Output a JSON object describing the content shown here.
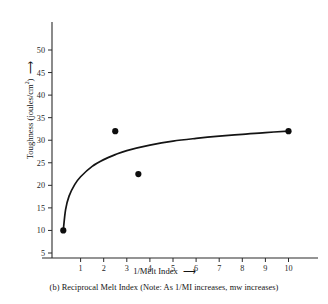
{
  "chart_data": {
    "type": "scatter",
    "title": "",
    "subtitle": "",
    "caption": "(b) Reciprocal Melt Index (Note: As 1/MI increases, mw increases)",
    "xlabel": "1/Melt Index",
    "xlabel_arrow": "⟶",
    "ylabel_prefix": "Toughness (joules/cm",
    "ylabel_exponent": "2",
    "ylabel_suffix": ")",
    "ylabel_arrow": "⟶",
    "xlim": [
      0,
      11.7
    ],
    "ylim": [
      3.5,
      52
    ],
    "grid": false,
    "legend": false,
    "xticks": [
      1,
      2,
      3,
      4,
      5,
      6,
      7,
      8,
      9,
      10
    ],
    "xticklabels": [
      "1",
      "2",
      "3",
      "4",
      "5",
      "6",
      "7",
      "8",
      "9",
      "10"
    ],
    "yticks": [
      5,
      10,
      15,
      20,
      25,
      30,
      35,
      40,
      45,
      50
    ],
    "yticklabels": [
      "5",
      "10",
      "15",
      "20",
      "25",
      "30",
      "35",
      "40",
      "45",
      "50"
    ],
    "series": [
      {
        "name": "data points",
        "marker": "filled-circle",
        "color": "#0d0d0d",
        "points": [
          {
            "x": 0.25,
            "y": 10.0
          },
          {
            "x": 2.5,
            "y": 32.0
          },
          {
            "x": 3.5,
            "y": 22.5
          },
          {
            "x": 10.0,
            "y": 32.0
          }
        ]
      },
      {
        "name": "fitted curve",
        "type": "line",
        "color": "#141414",
        "points": [
          {
            "x": 0.25,
            "y": 10.0
          },
          {
            "x": 0.35,
            "y": 14.6
          },
          {
            "x": 0.5,
            "y": 17.6
          },
          {
            "x": 0.75,
            "y": 20.2
          },
          {
            "x": 1.0,
            "y": 21.9
          },
          {
            "x": 1.5,
            "y": 24.2
          },
          {
            "x": 2.0,
            "y": 25.7
          },
          {
            "x": 2.5,
            "y": 26.8
          },
          {
            "x": 3.0,
            "y": 27.7
          },
          {
            "x": 4.0,
            "y": 28.9
          },
          {
            "x": 5.0,
            "y": 29.8
          },
          {
            "x": 6.0,
            "y": 30.4
          },
          {
            "x": 7.0,
            "y": 30.9
          },
          {
            "x": 8.0,
            "y": 31.3
          },
          {
            "x": 9.0,
            "y": 31.7
          },
          {
            "x": 10.0,
            "y": 32.0
          }
        ]
      }
    ]
  }
}
